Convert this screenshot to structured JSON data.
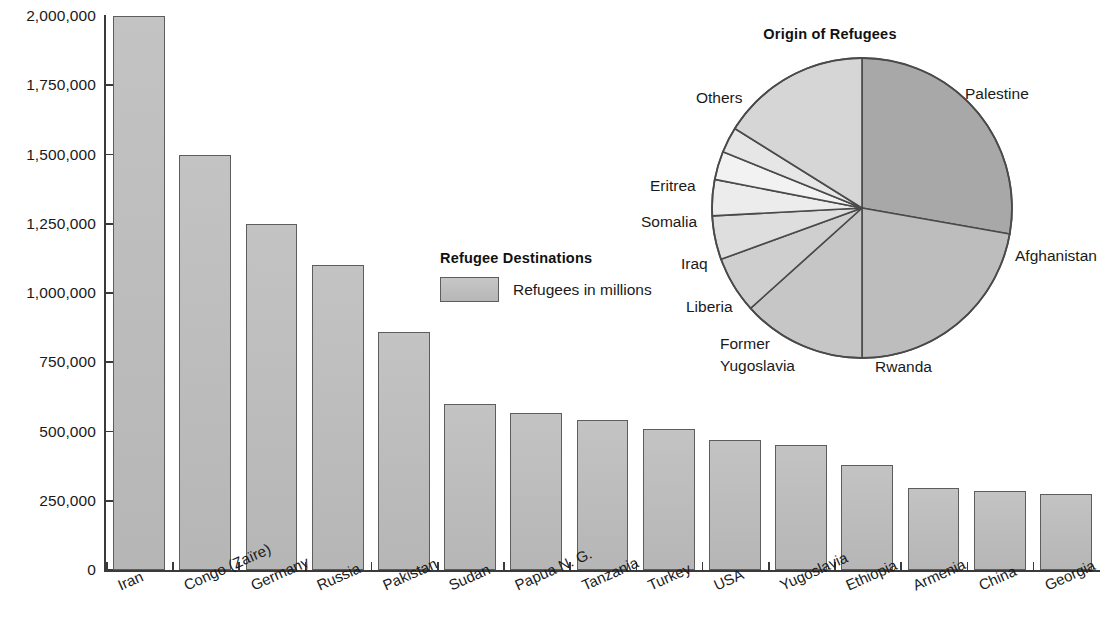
{
  "chart_data": [
    {
      "type": "bar",
      "title": "Refugee Destinations",
      "xlabel": "",
      "ylabel": "",
      "ylim": [
        0,
        2000000
      ],
      "grid": false,
      "legend": {
        "position": "inside-center",
        "entries": [
          "Refugees in millions"
        ]
      },
      "ytick_labels": [
        "2,000,000",
        "1,750,000",
        "1,500,000",
        "1,250,000",
        "1,000,000",
        "750,000",
        "500,000",
        "250,000",
        "0"
      ],
      "ytick_values": [
        2000000,
        1750000,
        1500000,
        1250000,
        1000000,
        750000,
        500000,
        250000,
        0
      ],
      "categories": [
        "Iran",
        "Congo (Zaïre)",
        "Germany",
        "Russia",
        "Pakistan",
        "Sudan",
        "Papua N. G.",
        "Tanzania",
        "Turkey",
        "USA",
        "Yugoslavia",
        "Ethiopia",
        "Armenia",
        "China",
        "Georgia"
      ],
      "values": [
        2000000,
        1500000,
        1250000,
        1100000,
        860000,
        600000,
        565000,
        540000,
        510000,
        470000,
        450000,
        380000,
        295000,
        285000,
        275000
      ],
      "bar_color": "#bdbdbd",
      "bar_border_color": "#5d5d5d"
    },
    {
      "type": "pie",
      "title": "Origin of Refugees",
      "start_angle_deg": 0,
      "direction": "clockwise",
      "labels": [
        "Palestine",
        "Afghanistan",
        "Rwanda",
        "Former Yugoslavia",
        "Liberia",
        "Iraq",
        "Somalia",
        "Eritrea",
        "Others"
      ],
      "angles_deg": [
        100,
        80,
        48,
        22,
        17,
        14,
        11,
        10,
        58
      ],
      "values_pct": [
        27.8,
        22.2,
        13.3,
        6.1,
        4.7,
        3.9,
        3.1,
        2.8,
        16.1
      ],
      "slice_colors": [
        "#a8a8a8",
        "#bdbdbd",
        "#c6c6c6",
        "#cfcfcf",
        "#dedede",
        "#ececec",
        "#f2f2f2",
        "#e6e6e6",
        "#d6d6d6"
      ],
      "border_color": "#4a4a4a"
    }
  ],
  "bar_chart": {
    "legend": {
      "title": "Refugee Destinations",
      "entry_label": "Refugees in millions"
    }
  },
  "pie_chart": {
    "title": "Origin of Refugees",
    "labels": {
      "palestine": "Palestine",
      "afghanistan": "Afghanistan",
      "rwanda": "Rwanda",
      "former_yugoslavia_line1": "Former",
      "former_yugoslavia_line2": "Yugoslavia",
      "liberia": "Liberia",
      "iraq": "Iraq",
      "somalia": "Somalia",
      "eritrea": "Eritrea",
      "others": "Others"
    }
  }
}
